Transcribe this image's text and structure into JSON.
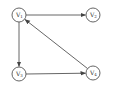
{
  "diagram": {
    "type": "directed-graph",
    "nodes": [
      {
        "id": "v1",
        "label": "V",
        "sub": "1",
        "x": 19,
        "y": 15
      },
      {
        "id": "v2",
        "label": "V",
        "sub": "2",
        "x": 93,
        "y": 15
      },
      {
        "id": "v3",
        "label": "V",
        "sub": "3",
        "x": 19,
        "y": 74
      },
      {
        "id": "v4",
        "label": "V",
        "sub": "4",
        "x": 93,
        "y": 73
      }
    ],
    "edges": [
      {
        "from": "v1",
        "to": "v2"
      },
      {
        "from": "v1",
        "to": "v3"
      },
      {
        "from": "v3",
        "to": "v4"
      },
      {
        "from": "v4",
        "to": "v1"
      }
    ],
    "colors": {
      "stroke": "#555555",
      "text": "#333333",
      "background": "#ffffff"
    }
  }
}
